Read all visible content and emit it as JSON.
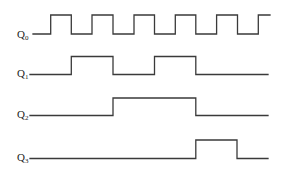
{
  "diagram": {
    "type": "timing-diagram",
    "stroke_color": "#3a3a3a",
    "signals": [
      {
        "name": "Q",
        "subscript": "0",
        "label_pos": [
          17,
          29
        ],
        "low_y": 34,
        "high_y": 15,
        "start_x": 33,
        "end_x": 270,
        "initial": "low",
        "edges": [
          50.7,
          71.3,
          92,
          113,
          134,
          154.5,
          175.3,
          195.8,
          216.6,
          237.5,
          258.3
        ]
      },
      {
        "name": "Q",
        "subscript": "1",
        "label_pos": [
          17,
          68
        ],
        "low_y": 74.5,
        "high_y": 56.5,
        "start_x": 30,
        "end_x": 268,
        "initial": "low",
        "edges": [
          71.3,
          113,
          154.5,
          195.8
        ]
      },
      {
        "name": "Q",
        "subscript": "2",
        "label_pos": [
          17,
          109
        ],
        "low_y": 115.5,
        "high_y": 98,
        "start_x": 30,
        "end_x": 268,
        "initial": "low",
        "edges": [
          113,
          195.8
        ]
      },
      {
        "name": "Q",
        "subscript": "3",
        "label_pos": [
          17,
          152
        ],
        "low_y": 158.5,
        "high_y": 140,
        "start_x": 30,
        "end_x": 268,
        "initial": "low",
        "edges": [
          195.8,
          237
        ]
      }
    ]
  }
}
